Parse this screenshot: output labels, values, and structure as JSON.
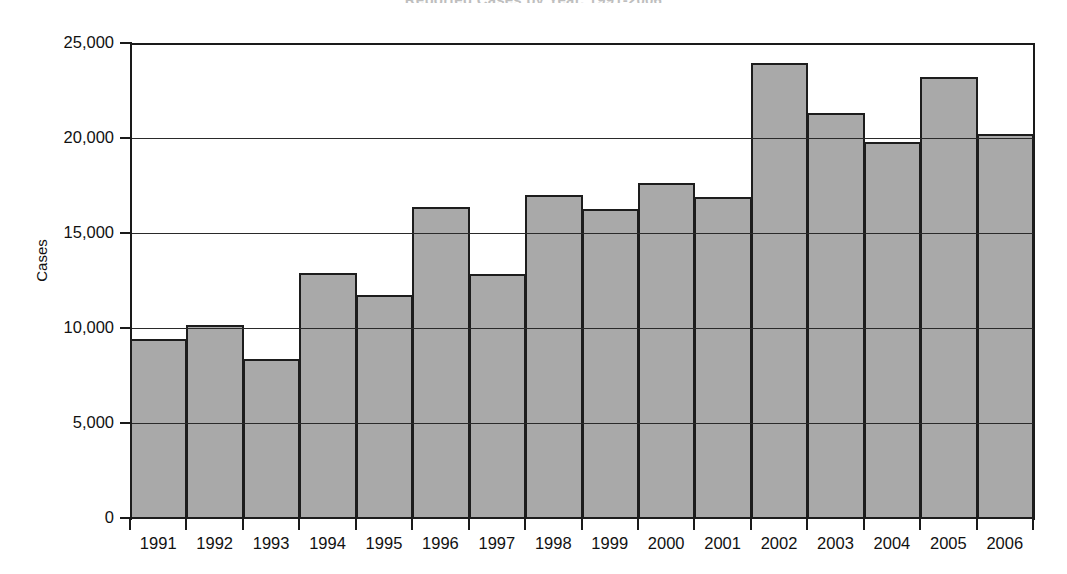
{
  "chart_data": {
    "type": "bar",
    "title": "Reported Cases by Year, 1991-2006",
    "xlabel": "",
    "ylabel": "Cases",
    "categories": [
      "1991",
      "1992",
      "1993",
      "1994",
      "1995",
      "1996",
      "1997",
      "1998",
      "1999",
      "2000",
      "2001",
      "2002",
      "2003",
      "2004",
      "2005",
      "2006"
    ],
    "values": [
      9500,
      10200,
      8400,
      12950,
      11800,
      16400,
      12900,
      17050,
      16300,
      17700,
      16950,
      24000,
      21350,
      19850,
      23250,
      20250
    ],
    "ylim": [
      0,
      25000
    ],
    "ytick_values": [
      0,
      5000,
      10000,
      15000,
      20000,
      25000
    ],
    "ytick_labels": [
      "0",
      "5,000",
      "10,000",
      "15,000",
      "20,000",
      "25,000"
    ],
    "grid": true,
    "legend": "none",
    "bar_gap": 0,
    "colors": {
      "bar_fill": "#a9a9a9",
      "bar_border": "#1d1d1d",
      "axis": "#1a1a1a",
      "gridline": "#2a2a2a",
      "text": "#111111",
      "background": "#ffffff"
    }
  }
}
